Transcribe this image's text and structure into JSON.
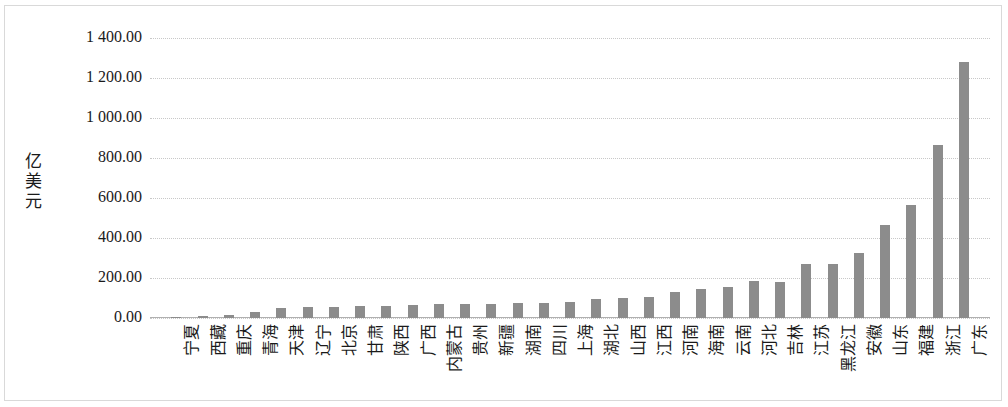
{
  "chart_data": {
    "type": "bar",
    "title": "",
    "subtitle": "",
    "xlabel": "",
    "ylabel": "亿美元",
    "ylim": [
      0,
      1400
    ],
    "ytick_labels": [
      "1 400.00",
      "1 200.00",
      "1 000.00",
      "800.00",
      "600.00",
      "400.00",
      "200.00",
      "0.00"
    ],
    "ytick_values": [
      1400,
      1200,
      1000,
      800,
      600,
      400,
      200,
      0
    ],
    "ytick_step": 200,
    "grid": true,
    "legend": null,
    "bar_color": "#8c8c8c",
    "categories": [
      "宁夏",
      "西藏",
      "重庆",
      "青海",
      "天津",
      "辽宁",
      "北京",
      "甘肃",
      "陕西",
      "广西",
      "内蒙古",
      "贵州",
      "新疆",
      "湖南",
      "四川",
      "上海",
      "湖北",
      "山西",
      "江西",
      "河南",
      "海南",
      "云南",
      "河北",
      "吉林",
      "江苏",
      "黑龙江",
      "安徽",
      "山东",
      "福建",
      "浙江",
      "广东"
    ],
    "values": [
      5,
      10,
      14,
      30,
      48,
      55,
      56,
      58,
      62,
      65,
      68,
      70,
      72,
      74,
      75,
      78,
      96,
      98,
      105,
      128,
      145,
      155,
      185,
      182,
      270,
      272,
      325,
      465,
      565,
      865,
      1280
    ]
  },
  "axis": {
    "y_title": "亿美元"
  }
}
